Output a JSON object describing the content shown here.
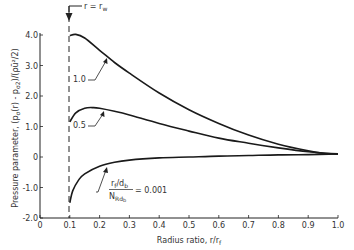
{
  "chart_data": {
    "type": "line",
    "title": "",
    "xlabel": "Radius ratio, r/r_f",
    "ylabel": "Pressure parameter, (p_σ(r) - p_σ2)/(ρ ū² / 2)",
    "xlim": [
      0,
      1.0
    ],
    "ylim": [
      -2.0,
      4.0
    ],
    "xticks": [
      "0",
      "0.1",
      "0.2",
      "0.3",
      "0.4",
      "0.5",
      "0.6",
      "0.7",
      "0.8",
      "0.9",
      "1.0"
    ],
    "yticks": [
      "-2.0",
      "-1.0",
      "0",
      "1.0",
      "2.0",
      "3.0",
      "4.0"
    ],
    "grid": false,
    "annotations": [
      {
        "text": "r = r_w",
        "x": 0.1,
        "note": "vertical dashed line at r/r_f = 0.1 with downward arrow"
      },
      {
        "text": "1.0",
        "series": "1.0"
      },
      {
        "text": "0.5",
        "series": "0.5"
      },
      {
        "text": "(r_f/d_b)/N_Rd_b = 0.001",
        "series": "0.001"
      }
    ],
    "series": [
      {
        "name": "1.0",
        "x": [
          0.1,
          0.12,
          0.15,
          0.2,
          0.25,
          0.3,
          0.4,
          0.5,
          0.6,
          0.7,
          0.8,
          0.9,
          0.95,
          1.0
        ],
        "values": [
          3.98,
          4.02,
          3.9,
          3.5,
          3.1,
          2.75,
          2.1,
          1.55,
          1.1,
          0.72,
          0.42,
          0.2,
          0.12,
          0.1
        ]
      },
      {
        "name": "0.5",
        "x": [
          0.1,
          0.12,
          0.15,
          0.18,
          0.2,
          0.25,
          0.3,
          0.4,
          0.5,
          0.6,
          0.7,
          0.8,
          0.9,
          0.95,
          1.0
        ],
        "values": [
          1.15,
          1.45,
          1.6,
          1.62,
          1.6,
          1.5,
          1.38,
          1.1,
          0.85,
          0.62,
          0.45,
          0.3,
          0.17,
          0.13,
          0.1
        ]
      },
      {
        "name": "0.001",
        "x": [
          0.1,
          0.11,
          0.13,
          0.15,
          0.2,
          0.25,
          0.3,
          0.4,
          0.5,
          0.6,
          0.7,
          0.8,
          0.9,
          1.0
        ],
        "values": [
          -1.5,
          -1.1,
          -0.75,
          -0.55,
          -0.3,
          -0.17,
          -0.1,
          -0.03,
          0.0,
          0.03,
          0.05,
          0.07,
          0.08,
          0.1
        ]
      }
    ]
  },
  "labels": {
    "curve_1": "1.0",
    "curve_05": "0.5",
    "curve_001_num": "r",
    "curve_001_num_sub": "f",
    "curve_001_num2": "/d",
    "curve_001_num2_sub": "b",
    "curve_001_den": "N",
    "curve_001_den_sub": "Rd",
    "curve_001_den_sub2": "b",
    "curve_001_val": "= 0.001",
    "rw_label": "r = r",
    "rw_sub": "w",
    "xlabel": "Radius ratio, r/r",
    "xlabel_sub": "f",
    "ylabel": "Pressure parameter, (p",
    "ylabel_rest": "(r) - p",
    "ylabel_tail": ")/(ρū²/2)"
  }
}
